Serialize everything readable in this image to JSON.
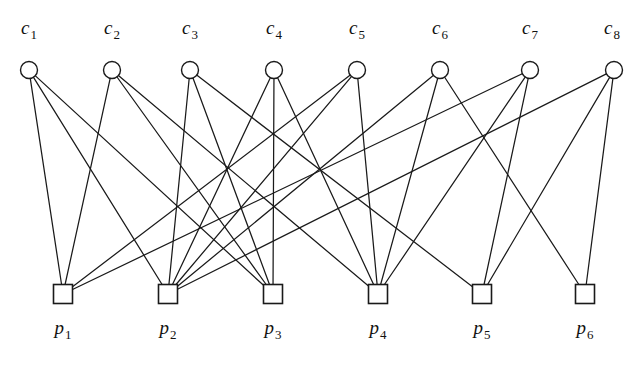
{
  "figure": {
    "width": 637,
    "height": 365,
    "background_color": "#ffffff",
    "edge_color": "#1a1a1a",
    "node_fill_color": "#ffffff",
    "node_stroke_color": "#1a1a1a"
  },
  "check_nodes": [
    {
      "id": "c1",
      "letter": "c",
      "subscript": "1",
      "label": "c₁",
      "shape": "circle",
      "x": 29,
      "y": 70,
      "r": 8.5,
      "label_x": 29,
      "label_y": 18,
      "degree": 3
    },
    {
      "id": "c2",
      "letter": "c",
      "subscript": "2",
      "label": "c₂",
      "shape": "circle",
      "x": 112,
      "y": 70,
      "r": 8.5,
      "label_x": 112,
      "label_y": 18,
      "degree": 3
    },
    {
      "id": "c3",
      "letter": "c",
      "subscript": "3",
      "label": "c₃",
      "shape": "circle",
      "x": 190,
      "y": 70,
      "r": 8.5,
      "label_x": 190,
      "label_y": 18,
      "degree": 3
    },
    {
      "id": "c4",
      "letter": "c",
      "subscript": "4",
      "label": "c₄",
      "shape": "circle",
      "x": 274,
      "y": 70,
      "r": 8.5,
      "label_x": 274,
      "label_y": 18,
      "degree": 3
    },
    {
      "id": "c5",
      "letter": "c",
      "subscript": "5",
      "label": "c₅",
      "shape": "circle",
      "x": 357,
      "y": 70,
      "r": 8.5,
      "label_x": 357,
      "label_y": 18,
      "degree": 3
    },
    {
      "id": "c6",
      "letter": "c",
      "subscript": "6",
      "label": "c₆",
      "shape": "circle",
      "x": 440,
      "y": 70,
      "r": 8.5,
      "label_x": 440,
      "label_y": 18,
      "degree": 3
    },
    {
      "id": "c7",
      "letter": "c",
      "subscript": "7",
      "label": "c₇",
      "shape": "circle",
      "x": 530,
      "y": 70,
      "r": 8.5,
      "label_x": 530,
      "label_y": 18,
      "degree": 3
    },
    {
      "id": "c8",
      "letter": "c",
      "subscript": "8",
      "label": "c₈",
      "shape": "circle",
      "x": 614,
      "y": 70,
      "r": 8.5,
      "label_x": 612,
      "label_y": 18,
      "degree": 3
    }
  ],
  "variable_nodes": [
    {
      "id": "p1",
      "letter": "p",
      "subscript": "1",
      "label": "p₁",
      "shape": "square",
      "x": 63,
      "y": 294,
      "size": 19,
      "label_x": 63,
      "label_y": 318,
      "degree": 4
    },
    {
      "id": "p2",
      "letter": "p",
      "subscript": "2",
      "label": "p₂",
      "shape": "square",
      "x": 168,
      "y": 294,
      "size": 19,
      "label_x": 168,
      "label_y": 318,
      "degree": 4
    },
    {
      "id": "p3",
      "letter": "p",
      "subscript": "3",
      "label": "p₃",
      "shape": "square",
      "x": 273,
      "y": 294,
      "size": 19,
      "label_x": 273,
      "label_y": 318,
      "degree": 4
    },
    {
      "id": "p4",
      "letter": "p",
      "subscript": "4",
      "label": "p₄",
      "shape": "square",
      "x": 378,
      "y": 294,
      "size": 19,
      "label_x": 378,
      "label_y": 318,
      "degree": 4
    },
    {
      "id": "p5",
      "letter": "p",
      "subscript": "5",
      "label": "p₅",
      "shape": "square",
      "x": 482,
      "y": 294,
      "size": 19,
      "label_x": 482,
      "label_y": 318,
      "degree": 4
    },
    {
      "id": "p6",
      "letter": "p",
      "subscript": "6",
      "label": "p₆",
      "shape": "square",
      "x": 585,
      "y": 294,
      "size": 19,
      "label_x": 585,
      "label_y": 318,
      "degree": 4
    }
  ],
  "edges": [
    {
      "from": "c1",
      "to": "p1"
    },
    {
      "from": "c1",
      "to": "p2"
    },
    {
      "from": "c1",
      "to": "p3"
    },
    {
      "from": "c2",
      "to": "p1"
    },
    {
      "from": "c2",
      "to": "p3"
    },
    {
      "from": "c2",
      "to": "p4"
    },
    {
      "from": "c3",
      "to": "p2"
    },
    {
      "from": "c3",
      "to": "p3"
    },
    {
      "from": "c3",
      "to": "p5"
    },
    {
      "from": "c4",
      "to": "p2"
    },
    {
      "from": "c4",
      "to": "p3"
    },
    {
      "from": "c4",
      "to": "p4"
    },
    {
      "from": "c5",
      "to": "p1"
    },
    {
      "from": "c5",
      "to": "p2"
    },
    {
      "from": "c5",
      "to": "p4"
    },
    {
      "from": "c6",
      "to": "p2"
    },
    {
      "from": "c6",
      "to": "p4"
    },
    {
      "from": "c6",
      "to": "p6"
    },
    {
      "from": "c7",
      "to": "p1"
    },
    {
      "from": "c7",
      "to": "p4"
    },
    {
      "from": "c7",
      "to": "p5"
    },
    {
      "from": "c8",
      "to": "p2"
    },
    {
      "from": "c8",
      "to": "p5"
    },
    {
      "from": "c8",
      "to": "p6"
    }
  ]
}
